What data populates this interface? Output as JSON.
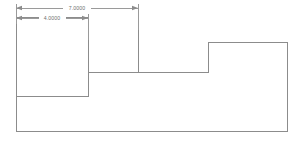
{
  "drawing": {
    "title": "Dimensioned stepped profile",
    "background_color": "#ffffff",
    "line_color": "#8c8c8c",
    "dimension_color": "#9a9a9a",
    "text_color": "#6f6f6f",
    "width": 304,
    "height": 144
  },
  "dimensions": [
    {
      "name": "overall-width-dimension",
      "label": "7.0000",
      "value": 7.0,
      "from_x": 16,
      "to_x": 138,
      "line_y": 8,
      "text_x": 77,
      "text_y": 8
    },
    {
      "name": "left-segment-dimension",
      "label": "4.0000",
      "value": 4.0,
      "from_x": 16,
      "to_x": 88,
      "line_y": 18,
      "text_x": 52,
      "text_y": 18
    }
  ],
  "profile": {
    "name": "stepped-outline",
    "description": "Closed polyline forming a descending then ascending stepped profile",
    "points": "16,131 16,17 88,17 88,96 16,96",
    "outline_path": "M16,131 L16,17 L88,17 L88,96 L16,96",
    "vertices": [
      {
        "x": 16,
        "y": 131
      },
      {
        "x": 16,
        "y": 17
      },
      {
        "x": 88,
        "y": 17
      },
      {
        "x": 88,
        "y": 72
      },
      {
        "x": 138,
        "y": 72
      },
      {
        "x": 138,
        "y": 17
      },
      {
        "x": 88,
        "y": 17
      },
      {
        "x": 88,
        "y": 96
      },
      {
        "x": 16,
        "y": 96
      },
      {
        "x": 208,
        "y": 72
      },
      {
        "x": 208,
        "y": 42
      },
      {
        "x": 287,
        "y": 42
      },
      {
        "x": 287,
        "y": 131
      }
    ],
    "main_path": "M16,96 L16,131 L287,131 L287,42 L208,42 L208,72 L88,72 L88,17 L16,17 L16,96 L88,96 L88,17",
    "step_paths": [
      "M16,17 L16,131",
      "M16,131 L287,131",
      "M287,131 L287,42",
      "M287,42 L208,42",
      "M208,42 L208,72",
      "M208,72 L138,72",
      "M138,72 L88,72",
      "M88,72 L88,17",
      "M88,17 L16,17",
      "M16,96 L88,96",
      "M88,96 L88,72",
      "M138,72 L138,17",
      "M138,17 L88,17"
    ]
  },
  "extension_lines": [
    {
      "name": "ext-left",
      "x": 16,
      "y1": 4,
      "y2": 24
    },
    {
      "name": "ext-mid",
      "x": 88,
      "y1": 14,
      "y2": 40
    },
    {
      "name": "ext-right",
      "x": 138,
      "y1": 4,
      "y2": 30
    }
  ]
}
